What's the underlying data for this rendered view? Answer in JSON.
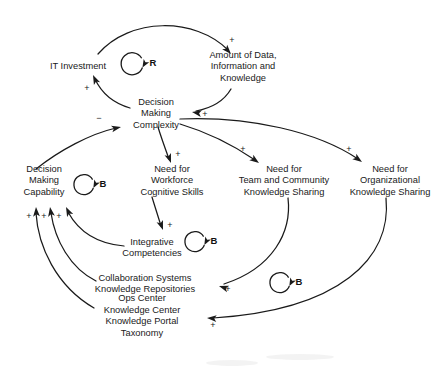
{
  "diagram": {
    "type": "causal-loop-diagram",
    "width": 442,
    "height": 375,
    "background_color": "#ffffff",
    "stroke_color": "#1a1a1a",
    "nodes": [
      {
        "id": "it_investment",
        "lines": [
          "IT Investment"
        ],
        "x": 78,
        "y": 66
      },
      {
        "id": "amount_of_data",
        "lines": [
          "Amount of Data,",
          "Information and",
          "Knowledge"
        ],
        "x": 243,
        "y": 66
      },
      {
        "id": "decision_making_complexity",
        "lines": [
          "Decision",
          "Making",
          "Complexity"
        ],
        "x": 156,
        "y": 113
      },
      {
        "id": "decision_making_capability",
        "lines": [
          "Decision",
          "Making",
          "Capability"
        ],
        "x": 44,
        "y": 180
      },
      {
        "id": "need_workforce_cognitive_skills",
        "lines": [
          "Need for",
          "Workforce",
          "Cognitive Skills"
        ],
        "x": 172,
        "y": 180
      },
      {
        "id": "need_team_community_knowledge_sharing",
        "lines": [
          "Need for",
          "Team and Community",
          "Knowledge Sharing"
        ],
        "x": 284,
        "y": 180
      },
      {
        "id": "need_organizational_knowledge_sharing",
        "lines": [
          "Need for",
          "Organizational",
          "Knowledge Sharing"
        ],
        "x": 390,
        "y": 180
      },
      {
        "id": "integrative_competencies",
        "lines": [
          "Integrative",
          "Competencies"
        ],
        "x": 152,
        "y": 247
      },
      {
        "id": "collaboration_systems",
        "lines": [
          "Collaboration Systems",
          "Knowledge Repositories"
        ],
        "x": 145,
        "y": 283
      },
      {
        "id": "ops_center",
        "lines": [
          "Ops Center",
          "Knowledge Center",
          "Knowledge Portal",
          "Taxonomy"
        ],
        "x": 142,
        "y": 315
      }
    ],
    "links": [
      {
        "id": "it-investment-to-amount-of-data",
        "from": "it_investment",
        "to": "amount_of_data",
        "polarity": "+",
        "polarity_x": 232,
        "polarity_y": 43,
        "path": "M 98 54 C 130 17 195 17 228 50",
        "arrow": {
          "x": 231,
          "y": 54,
          "angle": 48
        }
      },
      {
        "id": "amount-of-data-to-decision-making-complexity",
        "from": "amount_of_data",
        "to": "decision_making_complexity",
        "polarity": "+",
        "polarity_x": 205,
        "polarity_y": 117,
        "path": "M 231 89 C 224 101 212 108 196 111",
        "arrow": {
          "x": 192,
          "y": 112,
          "angle": 190
        }
      },
      {
        "id": "decision-making-complexity-to-it-investment",
        "from": "decision_making_complexity",
        "to": "it_investment",
        "polarity": "+",
        "polarity_x": 87,
        "polarity_y": 91,
        "path": "M 130 108 C 113 103 101 92 95 79",
        "arrow": {
          "x": 93,
          "y": 75,
          "angle": -115
        }
      },
      {
        "id": "decision-making-capability-to-decision-making-complexity",
        "from": "decision_making_capability",
        "to": "decision_making_complexity",
        "polarity": "-",
        "polarity_x": 99,
        "polarity_y": 121,
        "path": "M 36 169 C 60 150 90 134 116 128",
        "arrow": {
          "x": 121,
          "y": 127,
          "angle": -12
        }
      },
      {
        "id": "complexity-to-workforce-cognitive-skills",
        "from": "decision_making_complexity",
        "to": "need_workforce_cognitive_skills",
        "polarity": "+",
        "polarity_x": 178,
        "polarity_y": 157,
        "path": "M 158 127 C 161 137 165 148 169 159",
        "arrow": {
          "x": 171,
          "y": 163,
          "angle": 70
        }
      },
      {
        "id": "complexity-to-team-community-knowledge-sharing",
        "from": "decision_making_complexity",
        "to": "need_team_community_knowledge_sharing",
        "polarity": "+",
        "polarity_x": 243,
        "polarity_y": 152,
        "path": "M 180 124 C 210 133 236 147 255 160",
        "arrow": {
          "x": 259,
          "y": 163,
          "angle": 36
        }
      },
      {
        "id": "complexity-to-organizational-knowledge-sharing",
        "from": "decision_making_complexity",
        "to": "need_organizational_knowledge_sharing",
        "polarity": "+",
        "polarity_x": 349,
        "polarity_y": 152,
        "path": "M 180 119 C 250 116 318 132 358 159",
        "arrow": {
          "x": 362,
          "y": 162,
          "angle": 36
        }
      },
      {
        "id": "workforce-cognitive-skills-to-integrative-competencies",
        "from": "need_workforce_cognitive_skills",
        "to": "integrative_competencies",
        "polarity": "+",
        "polarity_x": 170,
        "polarity_y": 228,
        "path": "M 152 197 C 155 207 158 216 161 226",
        "arrow": {
          "x": 163,
          "y": 230,
          "angle": 70
        }
      },
      {
        "id": "team-community-to-collaboration-systems",
        "from": "need_team_community_knowledge_sharing",
        "to": "collaboration_systems",
        "polarity": "+",
        "polarity_x": 228,
        "polarity_y": 292,
        "path": "M 288 198 C 292 232 273 268 224 284",
        "arrow": {
          "x": 219,
          "y": 286,
          "angle": 198
        }
      },
      {
        "id": "organizational-knowledge-sharing-to-ops-center",
        "from": "need_organizational_knowledge_sharing",
        "to": "ops_center",
        "polarity": "+",
        "polarity_x": 213,
        "polarity_y": 328,
        "path": "M 386 198 C 392 258 340 310 213 318",
        "arrow": {
          "x": 207,
          "y": 318,
          "angle": 184
        }
      },
      {
        "id": "integrative-competencies-to-decision-making-capability",
        "from": "integrative_competencies",
        "to": "decision_making_capability",
        "polarity": "+",
        "polarity_x": 59,
        "polarity_y": 219,
        "path": "M 124 246 C 100 244 80 234 68 212",
        "arrow": {
          "x": 66,
          "y": 207,
          "angle": -116
        }
      },
      {
        "id": "collaboration-systems-to-decision-making-capability",
        "from": "collaboration_systems",
        "to": "decision_making_capability",
        "polarity": "+",
        "polarity_x": 44,
        "polarity_y": 219,
        "path": "M 96 281 C 70 268 55 240 51 213",
        "arrow": {
          "x": 50,
          "y": 207,
          "angle": -99
        }
      },
      {
        "id": "ops-center-to-decision-making-capability",
        "from": "ops_center",
        "to": "decision_making_capability",
        "polarity": "+",
        "polarity_x": 29,
        "polarity_y": 219,
        "path": "M 94 308 C 56 286 38 246 36 213",
        "arrow": {
          "x": 36,
          "y": 207,
          "angle": -93
        }
      }
    ],
    "loop_markers": [
      {
        "id": "loop-r-it-investment",
        "label": "R",
        "type": "reinforcing",
        "x": 152,
        "y": 62,
        "radius": 11,
        "direction": "clockwise"
      },
      {
        "id": "loop-b-capability",
        "label": "B",
        "type": "balancing",
        "x": 102,
        "y": 183,
        "radius": 10,
        "direction": "counter-clockwise"
      },
      {
        "id": "loop-b-integrative",
        "label": "B",
        "type": "balancing",
        "x": 213,
        "y": 240,
        "radius": 10,
        "direction": "counter-clockwise"
      },
      {
        "id": "loop-b-organizational",
        "label": "B",
        "type": "balancing",
        "x": 298,
        "y": 281,
        "radius": 10,
        "direction": "counter-clockwise"
      }
    ]
  }
}
